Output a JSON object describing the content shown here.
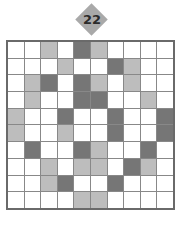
{
  "badge": {
    "label": "22",
    "color": "#a9a9a9"
  },
  "grid": {
    "rows": 10,
    "cols": 10,
    "legend": {
      "W": "white",
      "L": "light-gray",
      "D": "dark-gray"
    },
    "colors": {
      "W": "#ffffff",
      "L": "#bdbdbd",
      "D": "#767676"
    },
    "cells": [
      [
        "W",
        "W",
        "L",
        "W",
        "D",
        "L",
        "W",
        "W",
        "W",
        "W"
      ],
      [
        "W",
        "W",
        "W",
        "L",
        "W",
        "W",
        "D",
        "L",
        "W",
        "W"
      ],
      [
        "W",
        "L",
        "D",
        "W",
        "D",
        "L",
        "W",
        "L",
        "W",
        "W"
      ],
      [
        "W",
        "L",
        "W",
        "W",
        "D",
        "D",
        "W",
        "W",
        "L",
        "W"
      ],
      [
        "L",
        "W",
        "W",
        "D",
        "W",
        "W",
        "D",
        "W",
        "W",
        "D"
      ],
      [
        "L",
        "W",
        "W",
        "L",
        "W",
        "W",
        "D",
        "W",
        "W",
        "D"
      ],
      [
        "W",
        "D",
        "W",
        "W",
        "D",
        "L",
        "W",
        "W",
        "D",
        "W"
      ],
      [
        "W",
        "W",
        "L",
        "W",
        "L",
        "L",
        "W",
        "D",
        "L",
        "W"
      ],
      [
        "W",
        "W",
        "L",
        "D",
        "W",
        "W",
        "D",
        "W",
        "W",
        "W"
      ],
      [
        "W",
        "W",
        "W",
        "W",
        "L",
        "L",
        "W",
        "W",
        "W",
        "W"
      ]
    ]
  }
}
